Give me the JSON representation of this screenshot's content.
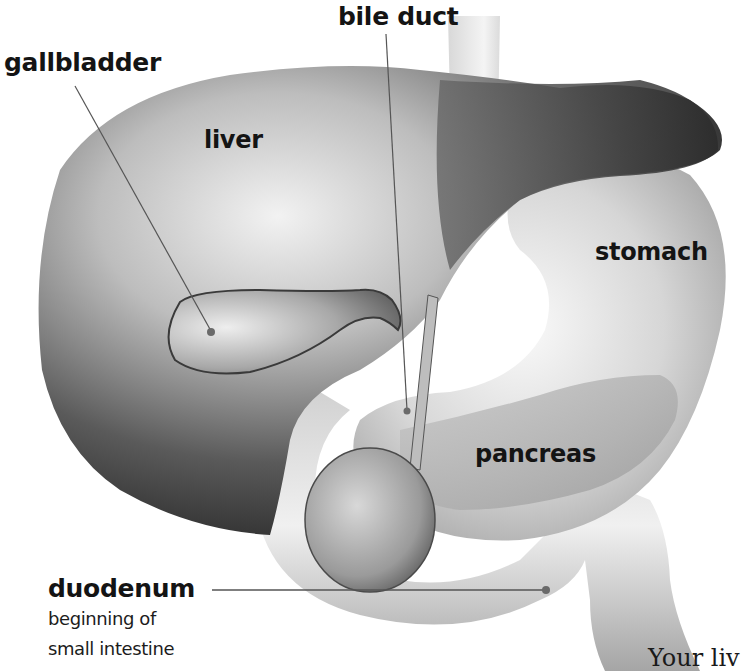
{
  "diagram": {
    "colors": {
      "background": "#ffffff",
      "text": "#141414",
      "leader_line": "#555555",
      "organ_dark": "#2a2a2a",
      "organ_light": "#e8e8e8"
    },
    "labels": {
      "gallbladder": "gallbladder",
      "bile_duct": "bile duct",
      "liver": "liver",
      "stomach": "stomach",
      "pancreas": "pancreas",
      "duodenum": "duodenum",
      "duodenum_desc_line1": "beginning of",
      "duodenum_desc_line2": "small intestine"
    },
    "caption_fragment": "Your liv"
  }
}
